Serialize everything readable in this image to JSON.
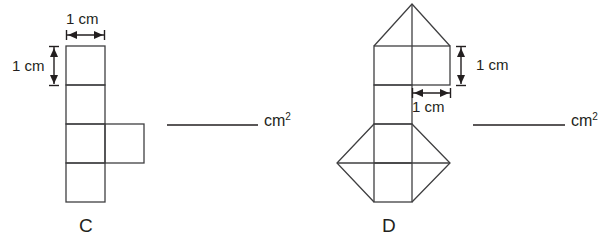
{
  "page": {
    "background_color": "#ffffff",
    "ink_color": "#231f20"
  },
  "figures": [
    {
      "id": "C",
      "label": "C",
      "shape_description": "pentomino: vertical column of four unit squares with one unit square attached to the right of the third square",
      "unit_squares": 5,
      "dimension_labels": {
        "width": "1 cm",
        "height": "1 cm"
      },
      "answer": {
        "blank_value": "",
        "units": "cm",
        "units_exponent": "2"
      }
    },
    {
      "id": "D",
      "label": "D",
      "shape_description": "composite: triangle peak over a 2x1 rectangle, a unit square stem, then a 2x1 rectangle with triangles on left and right forming a diamond",
      "unit_squares": 5,
      "triangles": 3,
      "dimension_labels": {
        "height": "1 cm",
        "width": "1 cm"
      },
      "answer": {
        "blank_value": "",
        "units": "cm",
        "units_exponent": "2"
      }
    }
  ]
}
